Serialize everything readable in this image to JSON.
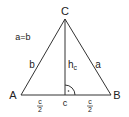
{
  "diagram": {
    "type": "isosceles-triangle",
    "condition": "a=b",
    "vertices": {
      "A": {
        "label": "A"
      },
      "B": {
        "label": "B"
      },
      "C": {
        "label": "C"
      }
    },
    "sides": {
      "a": "a",
      "b": "b",
      "c": "c"
    },
    "height": {
      "label": "h",
      "subscript": "c"
    },
    "half_base": {
      "numerator": "c",
      "denominator": "2"
    },
    "colors": {
      "line": "#333333",
      "text": "#222222"
    }
  }
}
